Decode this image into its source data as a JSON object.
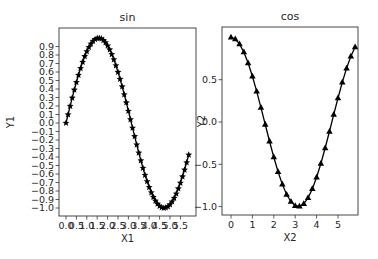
{
  "chart_data": [
    {
      "type": "line",
      "title": "sin",
      "xlabel": "X1",
      "ylabel": "Y1",
      "marker": "star",
      "color": "#000000",
      "x_start": 0.0,
      "x_step": 0.1,
      "n_points": 60,
      "function": "sin",
      "xlim": [
        -0.3,
        6.3
      ],
      "ylim": [
        -1.1,
        1.1
      ],
      "xticks": [
        "0.0",
        "0.5",
        "1.0",
        "1.5",
        "2.0",
        "2.5",
        "3.0",
        "3.5",
        "4.0",
        "4.5",
        "5.0",
        "5.5"
      ],
      "xtick_values": [
        0.0,
        0.5,
        1.0,
        1.5,
        2.0,
        2.5,
        3.0,
        3.5,
        4.0,
        4.5,
        5.0,
        5.5
      ],
      "yticks": [
        "0.9",
        "0.8",
        "0.7",
        "0.6",
        "0.5",
        "0.4",
        "0.3",
        "0.2",
        "0.1",
        "0.0",
        "−0.1",
        "−0.2",
        "−0.3",
        "−0.4",
        "−0.5",
        "−0.6",
        "−0.7",
        "−0.8",
        "−0.9",
        "−1.0"
      ],
      "ytick_values": [
        0.9,
        0.8,
        0.7,
        0.6,
        0.5,
        0.4,
        0.3,
        0.2,
        0.1,
        0.0,
        -0.1,
        -0.2,
        -0.3,
        -0.4,
        -0.5,
        -0.6,
        -0.7,
        -0.8,
        -0.9,
        -1.0
      ],
      "grid": false,
      "legend": null
    },
    {
      "type": "line",
      "title": "cos",
      "xlabel": "X2",
      "ylabel": "Y2",
      "marker": "triangle",
      "color": "#000000",
      "x_start": 0.0,
      "x_step": 0.2,
      "n_points": 30,
      "function": "cos",
      "xlim": [
        -0.29,
        6.09
      ],
      "ylim": [
        -1.1,
        1.1
      ],
      "xticks": [
        "0",
        "1",
        "2",
        "3",
        "4",
        "5"
      ],
      "xtick_values": [
        0,
        1,
        2,
        3,
        4,
        5
      ],
      "yticks": [
        "0.5",
        "0.0",
        "−0.5",
        "−1.0"
      ],
      "ytick_values": [
        0.5,
        0.0,
        -0.5,
        -1.0
      ],
      "grid": false,
      "legend": null
    }
  ],
  "axes_layout": [
    {
      "left": 59,
      "top": 28,
      "right": 196,
      "bottom": 216,
      "x0_px": 66,
      "px_per_x": 20.8,
      "y0_px": 123,
      "px_per_y": 85
    },
    {
      "left": 222,
      "top": 27,
      "right": 358,
      "bottom": 215,
      "x0_px": 231,
      "px_per_x": 21.4,
      "y0_px": 122,
      "px_per_y": 84.6
    }
  ]
}
